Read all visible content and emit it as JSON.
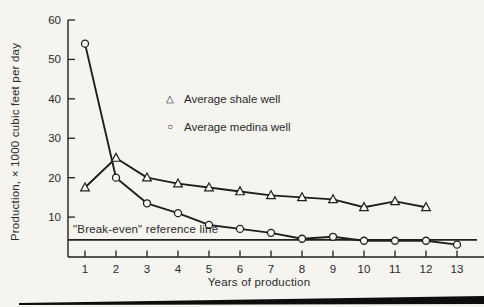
{
  "figure": {
    "background": "#f6f4ef",
    "ink": "#1f1f1f",
    "text_color": "#2a2a2a",
    "marker_fill": "#faf8f4"
  },
  "chart_data": {
    "type": "line",
    "title": "",
    "xlabel": "Years of production",
    "ylabel": "Production, × 1000 cubic feet per day",
    "x_ticks": [
      1,
      2,
      3,
      4,
      5,
      6,
      7,
      8,
      9,
      10,
      11,
      12,
      13
    ],
    "y_ticks": [
      10,
      20,
      30,
      40,
      50,
      60
    ],
    "xlim": [
      0,
      13.8
    ],
    "ylim": [
      0,
      60
    ],
    "grid": false,
    "legend_position": "inside-upper-center-left",
    "series": [
      {
        "name": "Average shale well",
        "marker": "triangle",
        "x": [
          1,
          2,
          3,
          4,
          5,
          6,
          7,
          8,
          9,
          10,
          11,
          12
        ],
        "values": [
          17.5,
          25,
          20,
          18.5,
          17.5,
          16.5,
          15.5,
          15,
          14.5,
          12.5,
          14,
          12.5
        ]
      },
      {
        "name": "Average medina well",
        "marker": "circle",
        "x": [
          1,
          2,
          3,
          4,
          5,
          6,
          7,
          8,
          9,
          10,
          11,
          12,
          13
        ],
        "values": [
          54,
          20,
          13.5,
          11,
          8,
          7,
          6,
          4.5,
          5,
          4,
          4,
          4,
          3
        ]
      }
    ],
    "reference_line": {
      "label": "\"Break-even\" reference line",
      "value": 4.2
    }
  },
  "icons": {
    "triangle": "△",
    "circle": "○"
  }
}
